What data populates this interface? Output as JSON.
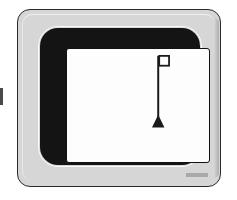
{
  "illustration": {
    "title": "CRT computer monitor displaying a flag marker",
    "style": "line-art black and white technical illustration"
  },
  "monitor": {
    "case_label": "monitor-case",
    "bezel_label": "crt-bezel",
    "brand_badge_text": "",
    "colors": {
      "case": "#d6d6d6",
      "case_outline": "#2b2b2b",
      "case_highlight": "#efefef",
      "bezel": "#141414",
      "bezel_rim": "#fafafa",
      "screen": "#fdfdfd",
      "screen_outline": "#111111",
      "marker": "#1a1a1a",
      "badge": "#a9a9a9",
      "edge_tick": "#4a4a4a"
    }
  },
  "screen": {
    "content_name": "flag-marker-symbol",
    "description": "vertical pole with a small open square flag at the top right and a solid triangle base",
    "marker": {
      "pole_x": 92,
      "pole_top_y": 7,
      "pole_bottom_y": 78,
      "pole_width": 2,
      "flag_square": {
        "x": 93,
        "y": 7,
        "size": 10
      },
      "triangle": {
        "center_x": 93,
        "apex_y": 68,
        "base_y": 80,
        "half_width": 6
      }
    }
  }
}
